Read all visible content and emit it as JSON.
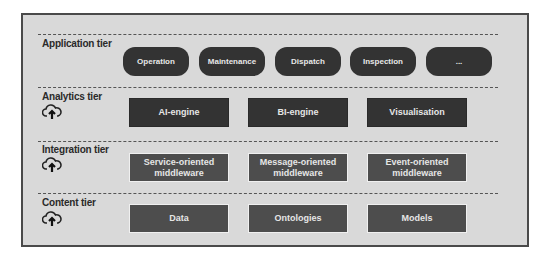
{
  "tiers": [
    {
      "label": "Application tier",
      "icon": "none",
      "items": [
        "Operation",
        "Maintenance",
        "Dispatch",
        "Inspection",
        "..."
      ]
    },
    {
      "label": "Analytics tier",
      "icon": "cloud-upload-icon",
      "items": [
        "AI-engine",
        "BI-engine",
        "Visualisation"
      ]
    },
    {
      "label": "Integration tier",
      "icon": "cloud-upload-icon",
      "items": [
        "Service-oriented\nmiddleware",
        "Message-oriented\nmiddleware",
        "Event-oriented\nmiddleware"
      ]
    },
    {
      "label": "Content tier",
      "icon": "cloud-upload-icon",
      "items": [
        "Data",
        "Ontologies",
        "Models"
      ]
    }
  ],
  "colors": {
    "background": "#d9d9d9",
    "pill": "#333333",
    "analytics_box": "#333333",
    "integration_box": "#4d4d4d",
    "content_box": "#4d4d4d",
    "text_light": "#e8e8e8",
    "label_text": "#2a2a2a"
  }
}
